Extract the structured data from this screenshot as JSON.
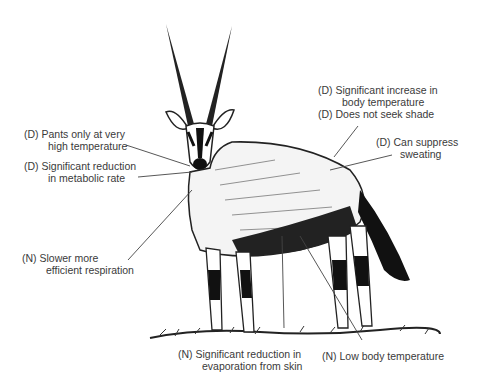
{
  "diagram": {
    "labels": [
      {
        "id": "pants",
        "code": "(D)",
        "line1": "Pants only at very",
        "line2": "high temperature"
      },
      {
        "id": "metabolic",
        "code": "(D)",
        "line1": "Significant reduction",
        "line2": "in metabolic rate"
      },
      {
        "id": "respiration",
        "code": "(N)",
        "line1": "Slower more",
        "line2": "efficient respiration"
      },
      {
        "id": "body-temp-increase",
        "code": "(D)",
        "line1": "Significant increase in",
        "line2": "body temperature"
      },
      {
        "id": "shade",
        "code": "(D)",
        "line1": "Does not seek shade",
        "line2": ""
      },
      {
        "id": "sweating",
        "code": "(D)",
        "line1": "Can suppress",
        "line2": "sweating"
      },
      {
        "id": "evaporation",
        "code": "(N)",
        "line1": "Significant reduction in",
        "line2": "evaporation from skin"
      },
      {
        "id": "low-temp",
        "code": "(N)",
        "line1": "Low body temperature",
        "line2": ""
      }
    ]
  }
}
